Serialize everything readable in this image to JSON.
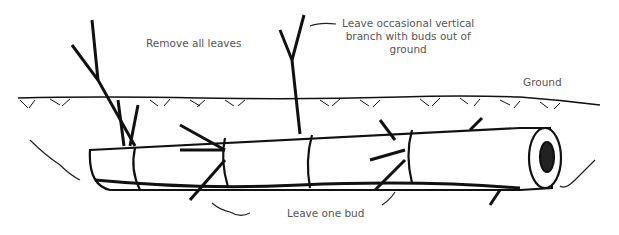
{
  "diagram": {
    "labels": {
      "remove_leaves": "Remove all leaves",
      "vertical_branch_line1": "Leave occasional vertical",
      "vertical_branch_line2": "branch with buds out of",
      "vertical_branch_line3": "ground",
      "ground": "Ground",
      "one_bud": "Leave one bud"
    },
    "colors": {
      "ink": "#111111",
      "text": "#555555",
      "background": "#ffffff"
    }
  }
}
